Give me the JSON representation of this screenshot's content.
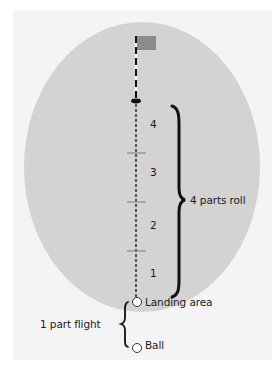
{
  "diagram": {
    "roll_segments": [
      {
        "label": "4"
      },
      {
        "label": "3"
      },
      {
        "label": "2"
      },
      {
        "label": "1"
      }
    ],
    "roll_bracket_label": "4 parts roll",
    "flight_bracket_label": "1 part flight",
    "landing_label": "Landing area",
    "ball_label": "Ball",
    "ratio": {
      "flight_parts": 1,
      "roll_parts": 4
    },
    "icons": {
      "flag": "flag-icon",
      "hole": "hole-icon",
      "landing": "landing-circle-icon",
      "ball": "ball-icon"
    },
    "colors": {
      "panel": "#f4f4f4",
      "green": "#d3d3d3",
      "flag": "#8c8c8c",
      "ink": "#111111",
      "tick": "#8a8a8a"
    }
  }
}
